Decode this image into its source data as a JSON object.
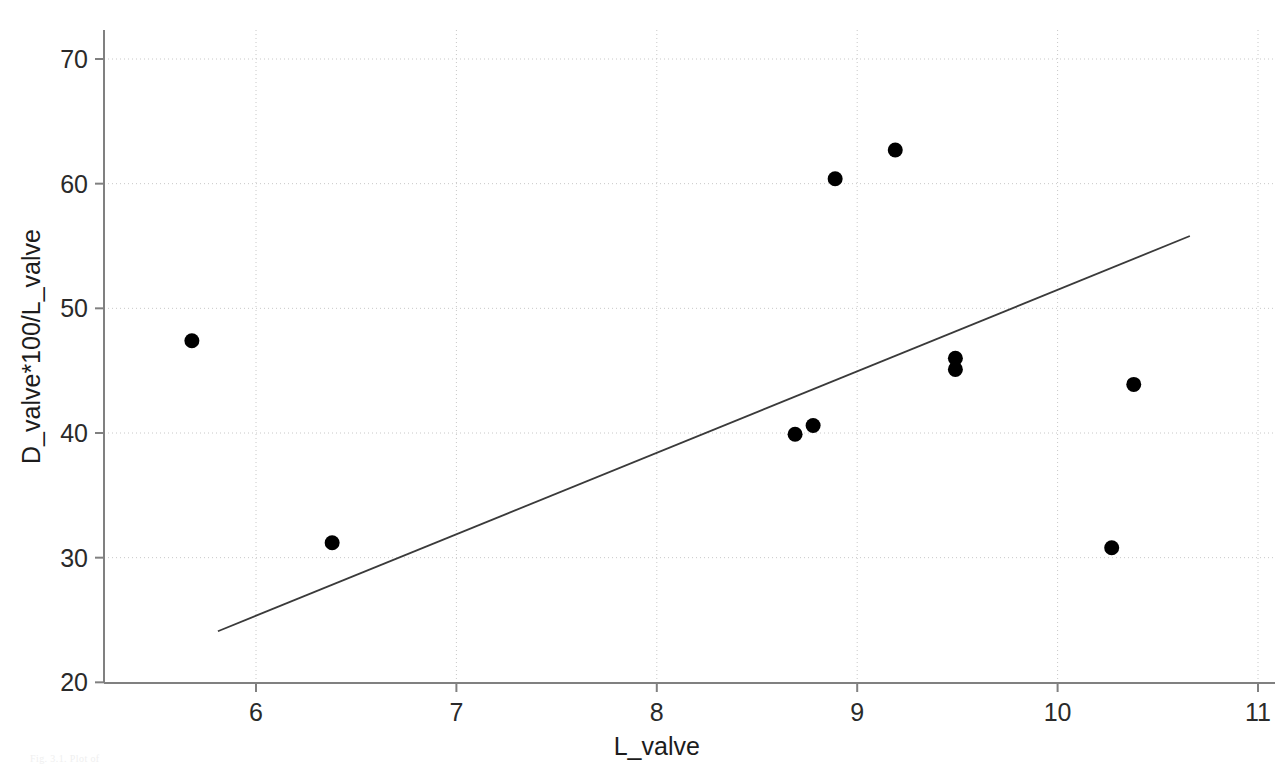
{
  "chart_data": {
    "type": "scatter",
    "title": "",
    "xlabel": "L_valve",
    "ylabel": "D_valve*100/L_valve",
    "xlim": [
      5.3,
      11.0
    ],
    "ylim": [
      20,
      72
    ],
    "xticks": [
      6,
      7,
      8,
      9,
      10,
      11
    ],
    "yticks": [
      20,
      30,
      40,
      50,
      60,
      70
    ],
    "grid": true,
    "legend": "none",
    "marker_color": "#000000",
    "line_color": "#3a3a3a",
    "grid_color": "#c8c8c8",
    "axis_color": "#808080",
    "points": [
      {
        "x": 5.68,
        "y": 47.4
      },
      {
        "x": 6.38,
        "y": 31.2
      },
      {
        "x": 8.69,
        "y": 39.9
      },
      {
        "x": 8.78,
        "y": 40.6
      },
      {
        "x": 8.89,
        "y": 60.4
      },
      {
        "x": 9.19,
        "y": 62.7
      },
      {
        "x": 9.49,
        "y": 46.0
      },
      {
        "x": 9.49,
        "y": 45.1
      },
      {
        "x": 10.27,
        "y": 30.8
      },
      {
        "x": 10.38,
        "y": 43.9
      }
    ],
    "fit_line": {
      "x0": 5.81,
      "y0": 24.1,
      "x1": 10.66,
      "y1": 55.8
    }
  },
  "caption": {
    "text": "Fig. 3.1. Plot of"
  },
  "axis": {
    "x_tick_labels": [
      "6",
      "7",
      "8",
      "9",
      "10",
      "11"
    ],
    "y_tick_labels": [
      "20",
      "30",
      "40",
      "50",
      "60",
      "70"
    ],
    "x_title": "L_valve",
    "y_title": "D_valve*100/L_valve"
  }
}
